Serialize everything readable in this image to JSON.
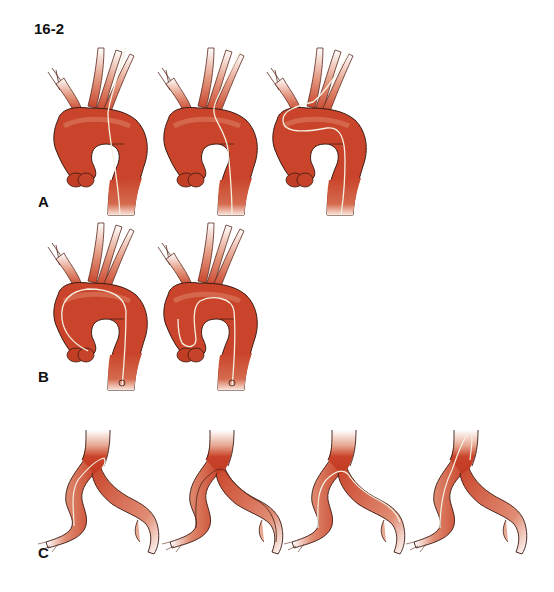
{
  "figure": {
    "number": "16-2",
    "panels": [
      {
        "label": "A",
        "subject": "aortic-arch",
        "count": 3,
        "wire": "guidewire-through-arch-into-branches"
      },
      {
        "label": "B",
        "subject": "aortic-arch",
        "count": 2,
        "wire": "pigtail-catheter-looped-in-ascending-aorta"
      },
      {
        "label": "C",
        "subject": "iliac-bifurcation",
        "count": 4,
        "wire": "crossover-wire-over-bifurcation"
      }
    ]
  },
  "colors": {
    "vessel": "#c9442a",
    "vessel_dark": "#a8321c",
    "vessel_light": "#f0c2b0",
    "outline": "#3a1a12",
    "wire": "#f4efe0",
    "label": "#111111"
  }
}
